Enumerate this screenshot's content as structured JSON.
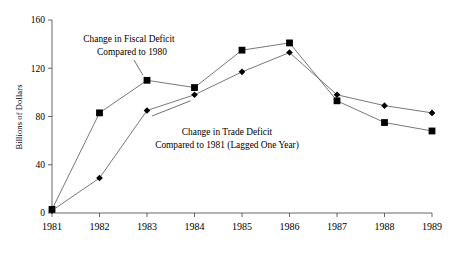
{
  "chart_data": {
    "type": "line",
    "title": "",
    "xlabel": "",
    "ylabel": "Billions of Dollars",
    "x": [
      1981,
      1982,
      1983,
      1984,
      1985,
      1986,
      1987,
      1988,
      1989
    ],
    "xticklabels": [
      "1981",
      "1982",
      "1983",
      "1984",
      "1985",
      "1986",
      "1987",
      "1988",
      "1989"
    ],
    "yticks": [
      0,
      40,
      80,
      120,
      160
    ],
    "yticklabels": [
      "0",
      "40",
      "80",
      "120",
      "160"
    ],
    "ylim": [
      0,
      160
    ],
    "xlim": [
      1981,
      1989
    ],
    "grid": false,
    "legend": "none",
    "series": [
      {
        "name": "Change in Fiscal Deficit Compared to 1980",
        "marker": "square",
        "values": [
          3,
          83,
          110,
          104,
          135,
          141,
          93,
          75,
          68
        ]
      },
      {
        "name": "Change in Trade Deficit Compared to 1981 (Lagged One Year)",
        "marker": "diamond",
        "values": [
          2,
          29,
          85,
          98,
          117,
          133,
          98,
          89,
          83
        ]
      }
    ],
    "annotations": [
      {
        "id": "fiscal",
        "lines": [
          "Change in Fiscal Deficit",
          "Compared to 1980"
        ],
        "points_to_year": 1983
      },
      {
        "id": "trade",
        "lines": [
          "Change in Trade Deficit",
          "Compared to 1981 (Lagged One Year)"
        ],
        "points_to_year": 1984
      }
    ]
  },
  "colors": {
    "marker": "#000000",
    "line": "#555555",
    "axis": "#555555",
    "text": "#000000",
    "background": "#ffffff"
  }
}
